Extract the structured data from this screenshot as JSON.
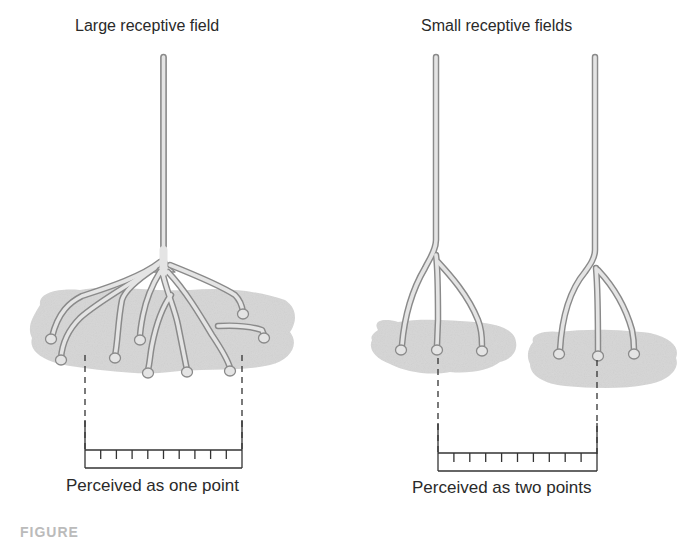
{
  "panels": {
    "large": {
      "title": "Large receptive field",
      "caption": "Perceived as one point",
      "branch_count": 9,
      "ruler_ticks": 9
    },
    "small": {
      "title": "Small receptive fields",
      "caption": "Perceived as two points",
      "neuron_count": 2,
      "branches_per_neuron": 3,
      "ruler_ticks": 9
    }
  },
  "figure_tag": "FIGURE",
  "colors": {
    "receptive_field": "#d4d4d4",
    "neuron_fill": "#e2e2e2",
    "neuron_outline": "#8a8a8a",
    "line": "#333333",
    "text": "#2a2a2a"
  }
}
